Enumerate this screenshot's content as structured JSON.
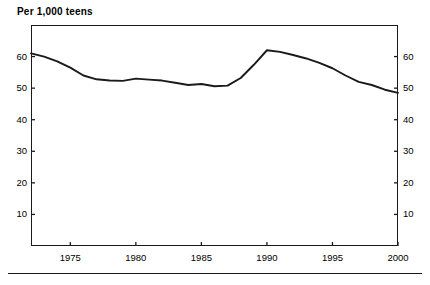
{
  "chart_data": {
    "type": "line",
    "title": "Per 1,000 teens",
    "xlabel": "",
    "ylabel": "",
    "xlim": [
      1972,
      2000
    ],
    "ylim": [
      0,
      70
    ],
    "grid": false,
    "legend": null,
    "y_ticks": [
      10,
      20,
      30,
      40,
      50,
      60
    ],
    "y_tick_labels": [
      "10",
      "20",
      "30",
      "40",
      "50",
      "60"
    ],
    "y_axis_right_labels": [
      "10",
      "20",
      "30",
      "40",
      "50",
      "60"
    ],
    "x_ticks": [
      1975,
      1980,
      1985,
      1990,
      1995,
      2000
    ],
    "x_tick_labels": [
      "1975",
      "1980",
      "1985",
      "1990",
      "1995",
      "2000"
    ],
    "series": [
      {
        "name": "Teen birth rate",
        "x": [
          1972,
          1973,
          1974,
          1975,
          1976,
          1977,
          1978,
          1979,
          1980,
          1981,
          1982,
          1983,
          1984,
          1985,
          1986,
          1987,
          1988,
          1989,
          1990,
          1991,
          1992,
          1993,
          1994,
          1995,
          1996,
          1997,
          1998,
          1999,
          2000
        ],
        "values": [
          61.0,
          60.0,
          58.5,
          56.5,
          54.0,
          52.8,
          52.4,
          52.3,
          53.0,
          52.7,
          52.4,
          51.7,
          51.0,
          51.3,
          50.6,
          50.8,
          53.2,
          57.4,
          62.0,
          61.5,
          60.5,
          59.4,
          58.0,
          56.3,
          54.0,
          52.0,
          51.0,
          49.5,
          48.5
        ]
      }
    ]
  },
  "axes": {
    "title_text": "Per 1,000 teens"
  }
}
